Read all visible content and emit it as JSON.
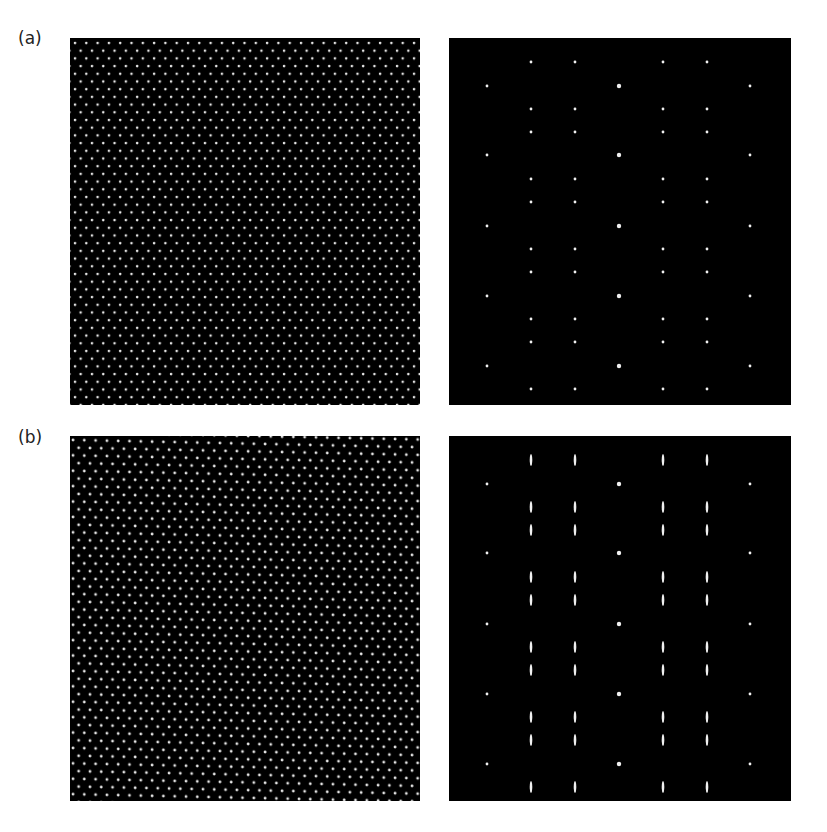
{
  "figure": {
    "rows": [
      {
        "label": "(a)",
        "real_space": {
          "description": "hexagonal lattice of bright dots",
          "dot_spacing_x": 11.3,
          "row_spacing_y": 7.7,
          "distortion": 0
        },
        "diffraction": {
          "description": "sharp diffraction spots",
          "streak": false
        }
      },
      {
        "label": "(b)",
        "real_space": {
          "description": "slightly distorted hexagonal lattice",
          "dot_spacing_x": 11.3,
          "row_spacing_y": 7.7,
          "distortion": 1
        },
        "diffraction": {
          "description": "diffraction spots with vertical streaks",
          "streak": true
        }
      }
    ],
    "colors": {
      "background": "#000000",
      "dot": "#e6e6e6",
      "page": "#ffffff"
    },
    "spot_columns": [
      38,
      82,
      126,
      170,
      214,
      258,
      301
    ],
    "spot_rows": [
      24,
      48,
      71,
      94,
      117,
      141,
      164,
      188,
      211,
      234,
      258,
      281,
      304,
      328,
      351
    ]
  }
}
